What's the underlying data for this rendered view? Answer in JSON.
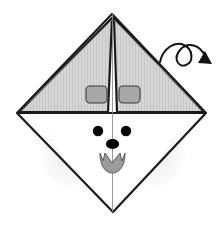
{
  "figure": {
    "type": "origami-instruction-diagram",
    "background_color": "#ffffff",
    "canvas": {
      "width": 221,
      "height": 226
    }
  },
  "colors": {
    "outline": "#1a1a1a",
    "paper_front": "#d4d4d4",
    "paper_hatch": "#c4c4c4",
    "paper_back": "#ffffff",
    "crease_light": "#9a9a9a",
    "ear_patch": "#a8a8a8",
    "ear_patch_outline": "#3a3a3a",
    "face_shadow": "#efefef",
    "eye": "#000000",
    "nose": "#000000",
    "tongue": "#9b9b9b",
    "tongue_outline": "#5a5a5a",
    "arrow": "#111111",
    "center_line": "#8d8d8d"
  },
  "shapes": {
    "diamond": {
      "name": "paper-outline-diamond",
      "top": {
        "x": 112,
        "y": 14
      },
      "right": {
        "x": 206,
        "y": 113
      },
      "bottom": {
        "x": 113,
        "y": 212
      },
      "left": {
        "x": 17,
        "y": 113
      },
      "stroke_width": 2.2
    },
    "horizontal_fold": {
      "name": "horizontal-fold-line",
      "from": {
        "x": 17,
        "y": 113
      },
      "to": {
        "x": 206,
        "y": 113
      }
    },
    "vertical_center_line": {
      "name": "vertical-center-crease",
      "from": {
        "x": 112.5,
        "y": 14
      },
      "to": {
        "x": 112.5,
        "y": 212
      }
    },
    "left_flap": {
      "name": "left-folded-flap",
      "points": "112,18 108,112 19,112"
    },
    "right_flap": {
      "name": "right-folded-flap",
      "points": "114,18 117,112 204,112"
    },
    "left_crease": {
      "name": "left-diagonal-crease",
      "from": {
        "x": 19,
        "y": 112
      },
      "to": {
        "x": 112,
        "y": 20
      }
    },
    "right_crease": {
      "name": "right-diagonal-crease",
      "from": {
        "x": 204,
        "y": 112
      },
      "to": {
        "x": 114,
        "y": 20
      }
    },
    "ear_patch_left": {
      "name": "left-ear-patch",
      "x": 86,
      "y": 86,
      "width": 21,
      "height": 17,
      "rx": 4
    },
    "ear_patch_right": {
      "name": "right-ear-patch",
      "x": 119,
      "y": 86,
      "width": 21,
      "height": 17,
      "rx": 4
    },
    "eye_left": {
      "name": "left-eye",
      "cx": 98,
      "cy": 131,
      "r": 5.2
    },
    "eye_right": {
      "name": "right-eye",
      "cx": 126,
      "cy": 131,
      "r": 5.2
    },
    "nose": {
      "name": "nose",
      "cx": 112.5,
      "cy": 144,
      "rx": 6.6,
      "ry": 5.0
    },
    "mouth": {
      "name": "open-mouth-tongue",
      "path": "M 100 153 L 103 161 L 105 153 L 112 163 L 120 153 L 122 161 L 125 153 C 125 168 118 173 112.5 173 C 107 173 100 168 100 153 Z"
    },
    "face_shadow_left": {
      "name": "left-cheek-shading",
      "path": "M 46 122 C 56 150 72 176 98 190 C 76 196 54 186 42 168 C 34 152 36 134 46 122 Z"
    },
    "face_shadow_right": {
      "name": "right-cheek-shading",
      "path": "M 179 122 C 169 150 153 176 127 190 C 149 196 171 186 183 168 C 191 152 189 134 179 122 Z"
    },
    "turn_over_arrow": {
      "name": "turn-over-arrow",
      "path": "M 160 62 C 163 48 175 41 184 45 C 193 49 194 62 186 65 C 178 68 173 58 180 50 C 188 41 200 45 205 56",
      "head": "205,51 212,64 198,63",
      "stroke_width": 2.0
    }
  },
  "labels": {
    "caption": "",
    "step_number": ""
  }
}
